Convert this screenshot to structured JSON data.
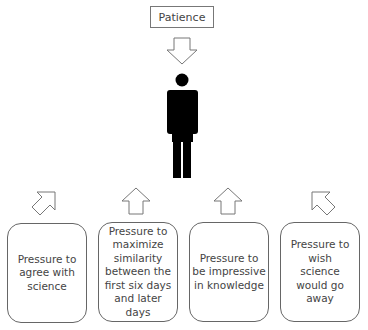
{
  "source": {
    "label": "Patience"
  },
  "figure": {
    "icon": "person-icon"
  },
  "pressures": [
    {
      "label": "Pressure to agree with science",
      "arrow": "arrow-up-right-icon"
    },
    {
      "label": "Pressure to maximize similarity between the first six days and later days",
      "arrow": "arrow-up-icon"
    },
    {
      "label": "Pressure to be impressive in knowledge",
      "arrow": "arrow-up-icon"
    },
    {
      "label": "Pressure to wish science would go away",
      "arrow": "arrow-up-left-icon"
    }
  ],
  "colors": {
    "stroke": "#666666",
    "figure": "#000000",
    "text": "#444444"
  }
}
